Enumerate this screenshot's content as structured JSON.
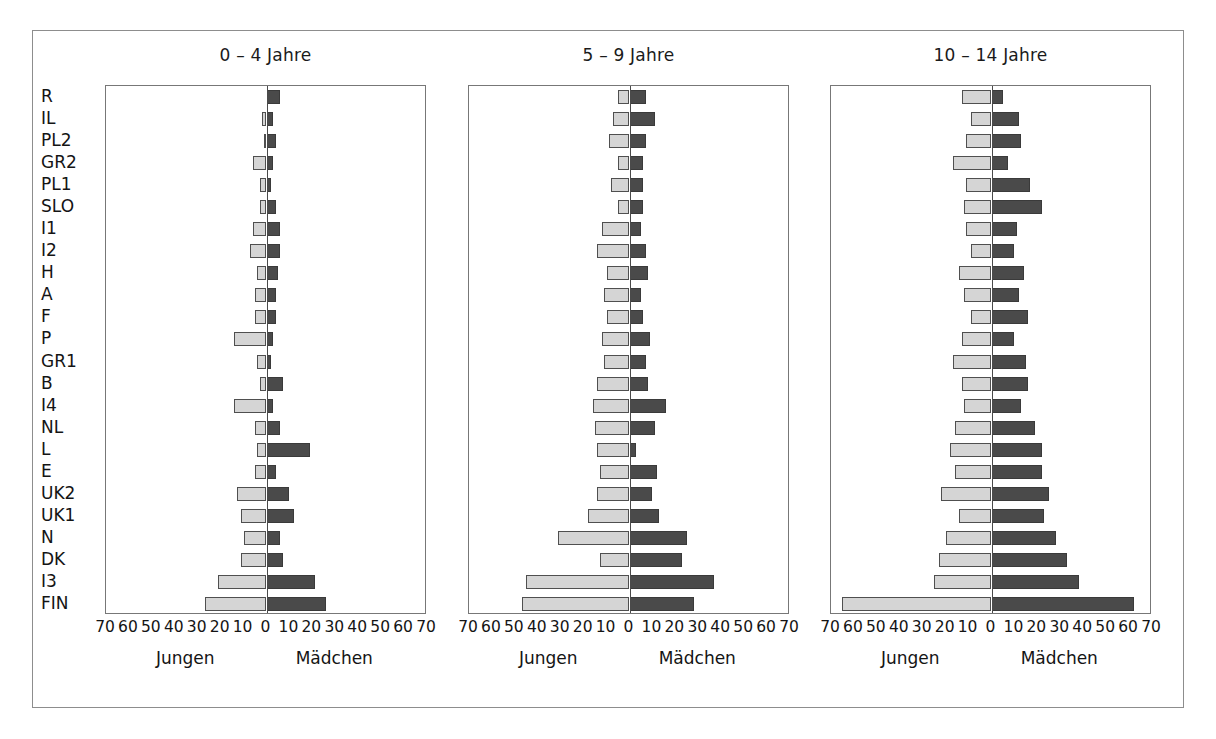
{
  "figure": {
    "categories": [
      "R",
      "IL",
      "PL2",
      "GR2",
      "PL1",
      "SLO",
      "I1",
      "I2",
      "H",
      "A",
      "F",
      "P",
      "GR1",
      "B",
      "I4",
      "NL",
      "L",
      "E",
      "UK2",
      "UK1",
      "N",
      "DK",
      "I3",
      "FIN"
    ],
    "tick_labels": [
      "70",
      "60",
      "50",
      "40",
      "30",
      "20",
      "10",
      "0",
      "10",
      "20",
      "30",
      "40",
      "50",
      "60",
      "70"
    ],
    "tick_values": [
      -70,
      -60,
      -50,
      -40,
      -30,
      -20,
      -10,
      0,
      10,
      20,
      30,
      40,
      50,
      60,
      70
    ],
    "left_caption": "Jungen",
    "right_caption": "Mädchen",
    "axis_min": -70,
    "axis_max": 70,
    "colors": {
      "boys": "#d5d5d5",
      "girls": "#4a4a4a",
      "frame": "#8d8d8d",
      "axis": "#777777",
      "text": "#141414"
    }
  },
  "chart_data": [
    {
      "type": "bar",
      "title": "0 – 4 Jahre",
      "xlabel": "",
      "ylabel": "",
      "xlim": [
        -70,
        70
      ],
      "grid": false,
      "orientation": "horizontal-diverging",
      "categories": [
        "R",
        "IL",
        "PL2",
        "GR2",
        "PL1",
        "SLO",
        "I1",
        "I2",
        "H",
        "A",
        "F",
        "P",
        "GR1",
        "B",
        "I4",
        "NL",
        "L",
        "E",
        "UK2",
        "UK1",
        "N",
        "DK",
        "I3",
        "FIN"
      ],
      "series": [
        {
          "name": "Jungen",
          "values": [
            0,
            2,
            1,
            6,
            3,
            3,
            6,
            7,
            4,
            5,
            5,
            14,
            4,
            3,
            14,
            5,
            4,
            5,
            13,
            11,
            10,
            11,
            21,
            27
          ]
        },
        {
          "name": "Mädchen",
          "values": [
            6,
            3,
            4,
            3,
            2,
            4,
            6,
            6,
            5,
            4,
            4,
            3,
            2,
            7,
            3,
            6,
            19,
            4,
            10,
            12,
            6,
            7,
            21,
            26
          ]
        }
      ]
    },
    {
      "type": "bar",
      "title": "5 – 9 Jahre",
      "xlabel": "",
      "ylabel": "",
      "xlim": [
        -70,
        70
      ],
      "grid": false,
      "orientation": "horizontal-diverging",
      "categories": [
        "R",
        "IL",
        "PL2",
        "GR2",
        "PL1",
        "SLO",
        "I1",
        "I2",
        "H",
        "A",
        "F",
        "P",
        "GR1",
        "B",
        "I4",
        "NL",
        "L",
        "E",
        "UK2",
        "UK1",
        "N",
        "DK",
        "I3",
        "FIN"
      ],
      "series": [
        {
          "name": "Jungen",
          "values": [
            5,
            7,
            9,
            5,
            8,
            5,
            12,
            14,
            10,
            11,
            10,
            12,
            11,
            14,
            16,
            15,
            14,
            13,
            14,
            18,
            31,
            13,
            45,
            47
          ]
        },
        {
          "name": "Mädchen",
          "values": [
            7,
            11,
            7,
            6,
            6,
            6,
            5,
            7,
            8,
            5,
            6,
            9,
            7,
            8,
            16,
            11,
            3,
            12,
            10,
            13,
            25,
            23,
            37,
            28
          ]
        }
      ]
    },
    {
      "type": "bar",
      "title": "10 – 14 Jahre",
      "xlabel": "",
      "ylabel": "",
      "xlim": [
        -70,
        70
      ],
      "grid": false,
      "orientation": "horizontal-diverging",
      "categories": [
        "R",
        "IL",
        "PL2",
        "GR2",
        "PL1",
        "SLO",
        "I1",
        "I2",
        "H",
        "A",
        "F",
        "P",
        "GR1",
        "B",
        "I4",
        "NL",
        "L",
        "E",
        "UK2",
        "UK1",
        "N",
        "DK",
        "I3",
        "FIN"
      ],
      "series": [
        {
          "name": "Jungen",
          "values": [
            13,
            9,
            11,
            17,
            11,
            12,
            11,
            9,
            14,
            12,
            9,
            13,
            17,
            13,
            12,
            16,
            18,
            16,
            22,
            14,
            20,
            23,
            25,
            65
          ]
        },
        {
          "name": "Mädchen",
          "values": [
            5,
            12,
            13,
            7,
            17,
            22,
            11,
            10,
            14,
            12,
            16,
            10,
            15,
            16,
            13,
            19,
            22,
            22,
            25,
            23,
            28,
            33,
            38,
            62
          ]
        }
      ]
    }
  ]
}
